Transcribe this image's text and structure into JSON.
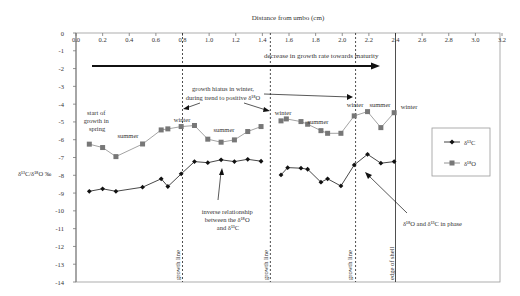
{
  "chart_data": {
    "type": "line",
    "title": "Distance from umbo (cm)",
    "xlabel": "Distance from umbo (cm)",
    "ylabel": "δ13C/δ18O ‰",
    "xlim": [
      0.0,
      3.2
    ],
    "ylim": [
      -14,
      0
    ],
    "x_ticks": [
      "0.0",
      "0.2",
      "0.4",
      "0.6",
      "0.8",
      "1.0",
      "1.2",
      "1.4",
      "1.6",
      "1.8",
      "2.0",
      "2.2",
      "2.4",
      "2.6",
      "2.8",
      "3.0",
      "3.2"
    ],
    "y_ticks": [
      "0",
      "-1",
      "-2",
      "-3",
      "-4",
      "-5",
      "-6",
      "-7",
      "-8",
      "-9",
      "-10",
      "-11",
      "-12",
      "-13",
      "-14"
    ],
    "grid": false,
    "legend_position": "right",
    "series": [
      {
        "name": "δ13C",
        "marker": "diamond",
        "color": "#111111",
        "segments": [
          [
            [
              0.1,
              -8.9
            ],
            [
              0.2,
              -8.76
            ],
            [
              0.3,
              -8.9
            ],
            [
              0.5,
              -8.67
            ],
            [
              0.64,
              -8.2
            ],
            [
              0.69,
              -8.63
            ],
            [
              0.79,
              -7.92
            ],
            [
              0.89,
              -7.23
            ],
            [
              0.99,
              -7.29
            ],
            [
              1.09,
              -7.13
            ],
            [
              1.19,
              -7.23
            ],
            [
              1.29,
              -7.1
            ],
            [
              1.39,
              -7.21
            ]
          ],
          [
            [
              1.54,
              -7.98
            ],
            [
              1.59,
              -7.57
            ],
            [
              1.69,
              -7.6
            ],
            [
              1.74,
              -7.66
            ],
            [
              1.84,
              -8.39
            ],
            [
              1.89,
              -8.2
            ],
            [
              1.99,
              -8.6
            ],
            [
              2.09,
              -7.42
            ],
            [
              2.19,
              -6.82
            ],
            [
              2.29,
              -7.32
            ],
            [
              2.39,
              -7.23
            ]
          ]
        ]
      },
      {
        "name": "δ18O",
        "marker": "square",
        "color": "#777777",
        "segments": [
          [
            [
              0.1,
              -6.25
            ],
            [
              0.2,
              -6.44
            ],
            [
              0.3,
              -6.95
            ],
            [
              0.5,
              -6.24
            ],
            [
              0.64,
              -5.45
            ],
            [
              0.69,
              -5.39
            ],
            [
              0.79,
              -5.26
            ],
            [
              0.89,
              -5.2
            ],
            [
              0.99,
              -5.97
            ],
            [
              1.09,
              -6.14
            ],
            [
              1.19,
              -6.01
            ],
            [
              1.29,
              -5.54
            ],
            [
              1.39,
              -5.26
            ]
          ],
          [
            [
              1.54,
              -4.94
            ],
            [
              1.58,
              -4.83
            ],
            [
              1.69,
              -4.98
            ],
            [
              1.74,
              -5.13
            ],
            [
              1.84,
              -5.49
            ],
            [
              1.89,
              -5.64
            ],
            [
              1.99,
              -5.64
            ],
            [
              2.09,
              -4.66
            ],
            [
              2.19,
              -4.42
            ],
            [
              2.29,
              -5.32
            ],
            [
              2.39,
              -4.48
            ]
          ]
        ]
      }
    ],
    "vertical_lines": [
      {
        "x": 0.8,
        "style": "dashed",
        "label": "growth line"
      },
      {
        "x": 1.46,
        "style": "dashed",
        "label": "growth line"
      },
      {
        "x": 2.1,
        "style": "dashed",
        "label": "growth line"
      },
      {
        "x": 2.4,
        "style": "solid",
        "label": "edge of shell"
      }
    ],
    "annotations": [
      {
        "text": "decrease in growth rate towards maturity",
        "type": "arrow",
        "from": [
          0.1,
          -2
        ],
        "to": [
          2.3,
          -2
        ]
      },
      {
        "text": "start of growth in spring"
      },
      {
        "text": "summer"
      },
      {
        "text": "winter"
      },
      {
        "text": "summer"
      },
      {
        "text": "winter"
      },
      {
        "text": "summer"
      },
      {
        "text": "winter"
      },
      {
        "text": "summer"
      },
      {
        "text": "winter"
      },
      {
        "text": "growth hiatus in winter, during trend to positive δ18O"
      },
      {
        "text": "inverse relationship between the δ18O and δ13C"
      },
      {
        "text": "δ18O and δ13C in phase"
      }
    ]
  },
  "labels": {
    "x_title": "Distance from umbo (cm)",
    "y_title": "δ¹³C/δ¹⁸O ‰",
    "arrow_note": "decrease in growth rate towards maturity",
    "hiatus_line1": "growth hiatus in winter,",
    "hiatus_line2": "during trend to positive δ¹⁸O",
    "start_line1": "start of",
    "start_line2": "growth in",
    "start_line3": "spring",
    "summer": "summer",
    "winter": "winter",
    "inverse_line1": "inverse relationship",
    "inverse_line2": "between the δ¹⁸O",
    "inverse_line3": "and δ¹³C",
    "inphase": "δ¹⁸O and δ¹³C in phase",
    "growth_line": "growth line",
    "edge_of_shell": "edge of shell",
    "legend_c": "δ¹³C",
    "legend_o": "δ¹⁸O"
  }
}
